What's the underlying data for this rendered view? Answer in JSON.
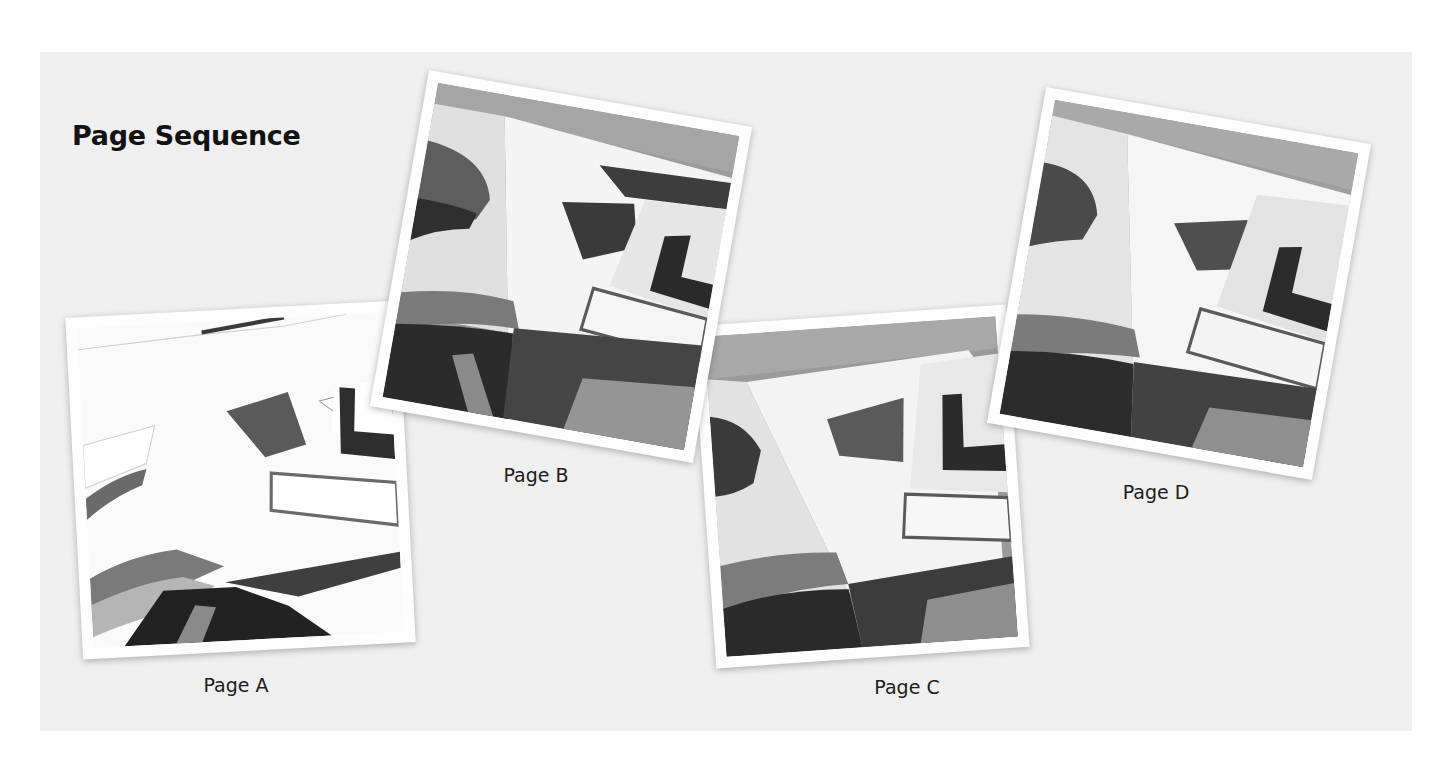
{
  "title": "Page Sequence",
  "colors": {
    "panel_background": "#efefef",
    "frame": "#fdfdfd",
    "text": "#121212"
  },
  "pages": [
    {
      "id": "A",
      "label": "Page A",
      "image": "grayscale painting of open books on a table (high-key, washed out)"
    },
    {
      "id": "B",
      "label": "Page B",
      "image": "grayscale painting of open books on a table"
    },
    {
      "id": "C",
      "label": "Page C",
      "image": "grayscale painting of open books on a table"
    },
    {
      "id": "D",
      "label": "Page D",
      "image": "grayscale painting of open books on a table"
    }
  ]
}
